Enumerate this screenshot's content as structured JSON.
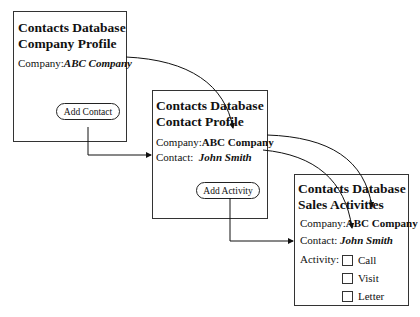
{
  "screens": [
    {
      "title_line1": "Contacts Database",
      "title_line2": "Company Profile",
      "company_label": "Company:",
      "company_value": "ABC Company",
      "button_label": "Add Contact"
    },
    {
      "title_line1": "Contacts Database",
      "title_line2": "Contact Profile",
      "company_label": "Company:",
      "company_value": "ABC Company",
      "contact_label": "Contact:",
      "contact_value": "John Smith",
      "button_label": "Add Activity"
    },
    {
      "title_line1": "Contacts Database",
      "title_line2": "Sales Activities",
      "company_label": "Company:",
      "company_value": "ABC Company",
      "contact_label": "Contact:",
      "contact_value": "John Smith",
      "activity_label": "Activity:",
      "activity_options": [
        "Call",
        "Visit",
        "Letter"
      ]
    }
  ],
  "connectors": [
    {
      "from": "company-profile.company-value",
      "to": "contact-profile.company-value",
      "type": "curved-arrow"
    },
    {
      "from": "company-profile.add-contact-button",
      "to": "contact-profile",
      "type": "elbow-arrow"
    },
    {
      "from": "contact-profile.company-value",
      "to": "sales-activities.company-value",
      "type": "curved-arrow"
    },
    {
      "from": "contact-profile.contact-value",
      "to": "sales-activities.contact-value",
      "type": "curved-arrow"
    },
    {
      "from": "contact-profile.add-activity-button",
      "to": "sales-activities",
      "type": "elbow-arrow"
    }
  ]
}
